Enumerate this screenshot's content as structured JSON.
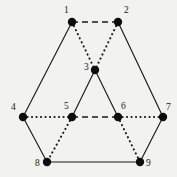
{
  "figure": {
    "background_color": "#f2f2f0",
    "ink_color": "#1a1a1a",
    "width": 177,
    "height": 177
  },
  "graph": {
    "vertex_radius": 4.2,
    "vertices": [
      {
        "id": "1",
        "label": "1",
        "x": 72,
        "y": 22,
        "label_x": 64,
        "label_y": 13
      },
      {
        "id": "2",
        "label": "2",
        "x": 118,
        "y": 22,
        "label_x": 124,
        "label_y": 13
      },
      {
        "id": "3",
        "label": "3",
        "x": 95,
        "y": 70,
        "label_x": 84,
        "label_y": 70
      },
      {
        "id": "4",
        "label": "4",
        "x": 23,
        "y": 117,
        "label_x": 11,
        "label_y": 110
      },
      {
        "id": "5",
        "label": "5",
        "x": 72,
        "y": 117,
        "label_x": 64,
        "label_y": 109
      },
      {
        "id": "6",
        "label": "6",
        "x": 118,
        "y": 117,
        "label_x": 121,
        "label_y": 109
      },
      {
        "id": "7",
        "label": "7",
        "x": 163,
        "y": 117,
        "label_x": 166,
        "label_y": 110
      },
      {
        "id": "8",
        "label": "8",
        "x": 47,
        "y": 162,
        "label_x": 35,
        "label_y": 166
      },
      {
        "id": "9",
        "label": "9",
        "x": 140,
        "y": 162,
        "label_x": 146,
        "label_y": 166
      }
    ],
    "edges": [
      {
        "from": "1",
        "to": "2",
        "style": "dashed"
      },
      {
        "from": "1",
        "to": "4",
        "style": "solid"
      },
      {
        "from": "1",
        "to": "3",
        "style": "dotted"
      },
      {
        "from": "2",
        "to": "7",
        "style": "solid"
      },
      {
        "from": "2",
        "to": "3",
        "style": "dotted"
      },
      {
        "from": "3",
        "to": "5",
        "style": "solid"
      },
      {
        "from": "3",
        "to": "6",
        "style": "solid"
      },
      {
        "from": "4",
        "to": "5",
        "style": "dotted"
      },
      {
        "from": "4",
        "to": "8",
        "style": "solid"
      },
      {
        "from": "5",
        "to": "6",
        "style": "dashed"
      },
      {
        "from": "5",
        "to": "8",
        "style": "dotted"
      },
      {
        "from": "6",
        "to": "7",
        "style": "dotted"
      },
      {
        "from": "6",
        "to": "9",
        "style": "dotted"
      },
      {
        "from": "7",
        "to": "9",
        "style": "solid"
      },
      {
        "from": "8",
        "to": "9",
        "style": "solid"
      }
    ]
  }
}
